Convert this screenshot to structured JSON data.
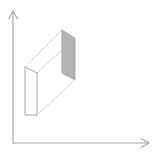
{
  "figure": {
    "title": "",
    "background_color": "#ffffff"
  },
  "axes": {
    "color": "#a3a3a3",
    "stroke_width": 1.1,
    "origin": {
      "x": 13,
      "y": 143
    },
    "y_axis": {
      "label": "",
      "from": {
        "x": 13,
        "y": 143
      },
      "to": {
        "x": 13,
        "y": 12
      },
      "arrow": "up-arrow",
      "arrow_tip": {
        "x": 13,
        "y": 11
      },
      "arrow_size": 6
    },
    "x_axis": {
      "label": "",
      "from": {
        "x": 13,
        "y": 143
      },
      "to": {
        "x": 148,
        "y": 143
      },
      "arrow": "right-arrow",
      "arrow_tip": {
        "x": 149,
        "y": 143
      },
      "arrow_size": 6
    }
  },
  "solid": {
    "name": "rectangular-slab",
    "front_face": {
      "name": "front-face",
      "fill": "#ffffff",
      "stroke": "#9e9e9e",
      "stroke_width": 1,
      "points": "25,67 37,73 37,115 25,115"
    },
    "back_face": {
      "name": "back-face",
      "fill": "#b4b4b4",
      "stroke": "#a8a8a8",
      "stroke_width": 1,
      "points": "62,30 75,38 75,80 62,73"
    },
    "connector_lines": [
      {
        "name": "top-left-connector",
        "from": {
          "x": 25,
          "y": 67
        },
        "to": {
          "x": 62,
          "y": 30
        },
        "style": "dotted",
        "color": "#b8b8b8"
      },
      {
        "name": "top-right-connector",
        "from": {
          "x": 37,
          "y": 73
        },
        "to": {
          "x": 75,
          "y": 38
        },
        "style": "dotted",
        "color": "#b8b8b8"
      },
      {
        "name": "bottom-right-connector",
        "from": {
          "x": 37,
          "y": 115
        },
        "to": {
          "x": 75,
          "y": 80
        },
        "style": "dotted",
        "color": "#b8b8b8"
      }
    ],
    "hidden_edge": {
      "name": "hidden-back-edge",
      "from": {
        "x": 62,
        "y": 30
      },
      "to": {
        "x": 62,
        "y": 73
      },
      "style": "solid",
      "color": "#c2c2c2"
    }
  },
  "colors": {
    "axis": "#a3a3a3",
    "shaded_face": "#b4b4b4",
    "outline": "#9e9e9e",
    "dotted": "#b8b8b8"
  },
  "labels": {
    "x_axis_label": "",
    "y_axis_label": "",
    "caption": ""
  }
}
